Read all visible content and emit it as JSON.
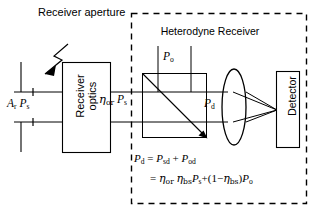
{
  "figure": {
    "title_outer": "Receiver aperture",
    "title_dashed_box": "Heterodyne Receiver",
    "blocks": {
      "receiver_optics_line1": "Receiver",
      "receiver_optics_line2": "optics",
      "detector": "Detector"
    },
    "labels": {
      "input_power": {
        "text": "A_r P_s",
        "parts": [
          {
            "v": "A",
            "sub": "r"
          },
          {
            "v": "P",
            "sub": "s"
          }
        ]
      },
      "after_optics": {
        "text": "η_or P_s",
        "parts": [
          {
            "v": "η",
            "sub": "or"
          },
          {
            "v": "P",
            "sub": "s"
          }
        ]
      },
      "local_oscillator": {
        "text": "P_o",
        "parts": [
          {
            "v": "P",
            "sub": "o"
          }
        ]
      },
      "detected": {
        "text": "P_d",
        "parts": [
          {
            "v": "P",
            "sub": "d"
          }
        ]
      }
    },
    "equations": {
      "eq1": "P_d = P_sd + P_od",
      "eq2": "= η_or η_bs P_s + (1−η_bs) P_o"
    },
    "colors": {
      "stroke": "#000000",
      "background": "#ffffff",
      "ray": "#000000"
    },
    "components": [
      "receiver-aperture-bars",
      "incoming-beam-arrow",
      "receiver-optics-box",
      "beam-splitter-cube",
      "local-oscillator-beam",
      "focusing-lens",
      "detector-box",
      "heterodyne-receiver-dashed-boundary"
    ]
  }
}
